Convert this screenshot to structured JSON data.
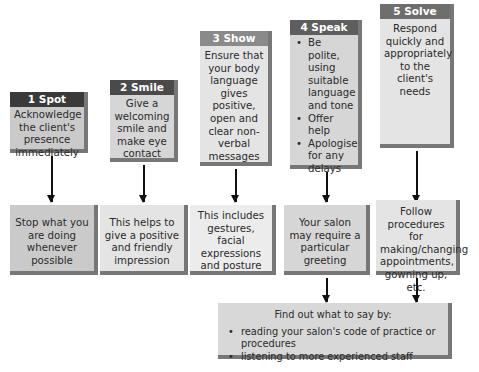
{
  "steps": [
    {
      "number": "1",
      "title": "1 Spot",
      "header_color": "#3a3a3a",
      "text": "Acknowledge the client's presence immediately",
      "result": "Stop what you are doing whenever possible"
    },
    {
      "number": "2",
      "title": "2 Smile",
      "header_color": "#4a4a4a",
      "text": "Give a welcoming smile and make eye contact",
      "result": "This helps to give a positive and friendly impression"
    },
    {
      "number": "3",
      "title": "3 Show",
      "header_color": "#8a8a8a",
      "text": "Ensure that your body language gives positive, open and clear non-verbal messages",
      "result": "This includes gestures, facial expressions and posture"
    },
    {
      "number": "4",
      "title": "4 Speak",
      "header_color": "#5e5e5e",
      "bullets": [
        "Be polite, using suitable language and tone",
        "Offer help",
        "Apologise for any delays"
      ],
      "result": "Your salon may require a particular greeting"
    },
    {
      "number": "5",
      "title": "5 Solve",
      "header_color": "#6e6e6e",
      "text": "Respond quickly and appropriately to the client's needs",
      "result": "Follow procedures for making/changing appointments, gowning up, etc."
    }
  ],
  "find_out": {
    "title": "Find out what to say by:",
    "items": [
      "reading your salon's code of practice or procedures",
      "listening to more experienced staff"
    ]
  }
}
